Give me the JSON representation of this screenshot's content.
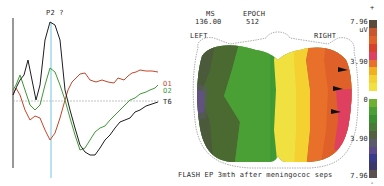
{
  "chart_data": [
    {
      "type": "line",
      "title": "P2 ?",
      "xlabel": "",
      "ylabel": "",
      "grid": false,
      "annotations": [
        "P2 ?"
      ],
      "series": [
        {
          "name": "O1",
          "color": "#c8452a",
          "points": [
            [
              13,
              95
            ],
            [
              16,
              88
            ],
            [
              20,
              95
            ],
            [
              25,
              110
            ],
            [
              30,
              120
            ],
            [
              35,
              116
            ],
            [
              40,
              118
            ],
            [
              45,
              130
            ],
            [
              50,
              140
            ],
            [
              55,
              133
            ],
            [
              60,
              118
            ],
            [
              65,
              100
            ],
            [
              68,
              90
            ],
            [
              72,
              82
            ],
            [
              76,
              78
            ],
            [
              80,
              74
            ],
            [
              85,
              73
            ],
            [
              90,
              80
            ],
            [
              96,
              82
            ],
            [
              102,
              80
            ],
            [
              108,
              82
            ],
            [
              114,
              83
            ],
            [
              118,
              78
            ],
            [
              124,
              80
            ],
            [
              128,
              76
            ],
            [
              132,
              73
            ],
            [
              136,
              72
            ],
            [
              140,
              70
            ],
            [
              146,
              71
            ],
            [
              152,
              71
            ],
            [
              158,
              72
            ]
          ]
        },
        {
          "name": "O2",
          "color": "#3f9a36",
          "points": [
            [
              13,
              90
            ],
            [
              16,
              85
            ],
            [
              20,
              75
            ],
            [
              25,
              90
            ],
            [
              30,
              105
            ],
            [
              35,
              110
            ],
            [
              40,
              105
            ],
            [
              45,
              85
            ],
            [
              50,
              68
            ],
            [
              55,
              72
            ],
            [
              60,
              85
            ],
            [
              65,
              100
            ],
            [
              70,
              118
            ],
            [
              75,
              135
            ],
            [
              80,
              150
            ],
            [
              85,
              148
            ],
            [
              90,
              140
            ],
            [
              95,
              132
            ],
            [
              100,
              128
            ],
            [
              105,
              126
            ],
            [
              110,
              120
            ],
            [
              115,
              115
            ],
            [
              120,
              110
            ],
            [
              125,
              105
            ],
            [
              130,
              100
            ],
            [
              135,
              98
            ],
            [
              140,
              94
            ],
            [
              146,
              92
            ],
            [
              150,
              90
            ],
            [
              155,
              88
            ],
            [
              158,
              85
            ]
          ]
        },
        {
          "name": "T6",
          "color": "#1e1e1e",
          "points": [
            [
              13,
              95
            ],
            [
              16,
              88
            ],
            [
              20,
              80
            ],
            [
              24,
              75
            ],
            [
              28,
              60
            ],
            [
              32,
              80
            ],
            [
              36,
              100
            ],
            [
              40,
              85
            ],
            [
              45,
              40
            ],
            [
              50,
              22
            ],
            [
              55,
              25
            ],
            [
              60,
              40
            ],
            [
              65,
              90
            ],
            [
              70,
              110
            ],
            [
              75,
              128
            ],
            [
              80,
              145
            ],
            [
              85,
              152
            ],
            [
              90,
              155
            ],
            [
              95,
              155
            ],
            [
              100,
              148
            ],
            [
              105,
              140
            ],
            [
              110,
              135
            ],
            [
              115,
              128
            ],
            [
              120,
              122
            ],
            [
              125,
              120
            ],
            [
              130,
              118
            ],
            [
              135,
              112
            ],
            [
              140,
              110
            ],
            [
              146,
              106
            ],
            [
              152,
              104
            ],
            [
              158,
              102
            ]
          ]
        }
      ],
      "baseline_y": 101,
      "vertical_marker_x": 51,
      "legend": [
        "O1",
        "O2",
        "T6"
      ],
      "legend_position": "right"
    },
    {
      "type": "heatmap",
      "title": "FLASH EP 3mth after meningococ seps",
      "header": {
        "ms_label": "MS",
        "ms_value": "136.00",
        "epoch_label": "EPOCH",
        "epoch_value": "512"
      },
      "side_labels": {
        "left": "LEFT",
        "right": "RIGHT"
      },
      "colorbar": {
        "unit": "uV",
        "top_sign": "+",
        "bottom_sign": "-",
        "ticks": [
          "7.96",
          "3.90",
          "0",
          "3.90",
          "7.96"
        ],
        "range": [
          -7.96,
          7.96
        ],
        "colors": [
          "#5a4a3a",
          "#c8552e",
          "#e0602a",
          "#d8402a",
          "#e04060",
          "#e8702a",
          "#f0b020",
          "#f4d030",
          "#f0e040",
          "#70b030",
          "#4aa035",
          "#3a9030",
          "#4a7a35",
          "#506040",
          "#5a5a6a",
          "#5a4a8a",
          "#3a3a8a",
          "#3a3a6a",
          "#4a3a5a",
          "#5a5050"
        ]
      },
      "regions": [
        {
          "area": "left-posterior",
          "value_range": "-3.90 to -7.96",
          "color": "#4a5a35"
        },
        {
          "area": "left-lateral",
          "value_range": "-7.96",
          "color": "#6a4a9a"
        },
        {
          "area": "center",
          "value_range": "0 to -3.90",
          "color": "#3f9a36"
        },
        {
          "area": "right-center",
          "value_range": "0 to 3.90",
          "color": "#f4d030"
        },
        {
          "area": "right-lateral",
          "value_range": "3.90 to 7.96",
          "color": "#e0602a"
        }
      ],
      "arrows": 3
    }
  ],
  "waveform": {
    "peak_label": "P2 ?",
    "traces": [
      {
        "label": "O1"
      },
      {
        "label": "O2"
      },
      {
        "label": "T6"
      }
    ]
  },
  "map": {
    "ms_label": "MS",
    "ms_value": "136.00",
    "epoch_label": "EPOCH",
    "epoch_value": "512",
    "left_label": "LEFT",
    "right_label": "RIGHT",
    "caption": "FLASH EP 3mth after meningococ seps"
  },
  "colorbar": {
    "plus": "+",
    "minus": "-",
    "unit": "uV",
    "t1": "7.96",
    "t2": "3.90",
    "t3": "0",
    "t4": "3.90",
    "t5": "7.96"
  }
}
